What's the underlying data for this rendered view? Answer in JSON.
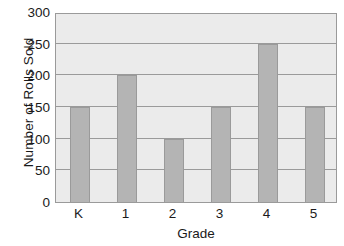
{
  "chart_data": {
    "type": "bar",
    "title": "",
    "xlabel": "Grade",
    "ylabel": "Number of Rolls Sold",
    "categories": [
      "K",
      "1",
      "2",
      "3",
      "4",
      "5"
    ],
    "values": [
      150,
      200,
      100,
      150,
      250,
      150
    ],
    "series": [
      {
        "name": "Rolls Sold",
        "values": [
          150,
          200,
          100,
          150,
          250,
          150
        ]
      }
    ],
    "ylim": [
      0,
      300
    ],
    "yticks": [
      0,
      50,
      100,
      150,
      200,
      250,
      300
    ],
    "ytick_labels": [
      "0",
      "50",
      "100",
      "150",
      "200",
      "250",
      "300"
    ],
    "grid": true,
    "grid_axis": "y",
    "legend": false,
    "legend_position": "none",
    "colors": {
      "bar_fill": "#b4b4b4",
      "bar_edge": "#9a9a9a",
      "plot_background": "#ebebeb",
      "gridline": "#9a9a9a",
      "axis_frame": "#9a9a9a",
      "text": "#1a1a1a",
      "figure_background": "#ffffff"
    }
  }
}
